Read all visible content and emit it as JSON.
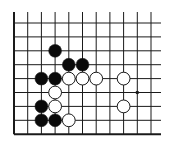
{
  "diagram": {
    "type": "go-board-fragment",
    "columns": 11,
    "rows": 9,
    "edges": {
      "left": "board-edge",
      "bottom": "board-edge",
      "top": "open",
      "right": "open"
    },
    "star_points": [
      {
        "col": 9,
        "row": 5
      }
    ],
    "stones": [
      {
        "color": "black",
        "col": 3,
        "row": 2
      },
      {
        "color": "black",
        "col": 4,
        "row": 3
      },
      {
        "color": "black",
        "col": 5,
        "row": 3
      },
      {
        "color": "black",
        "col": 2,
        "row": 4
      },
      {
        "color": "black",
        "col": 3,
        "row": 4
      },
      {
        "color": "white",
        "col": 4,
        "row": 4
      },
      {
        "color": "white",
        "col": 5,
        "row": 4
      },
      {
        "color": "white",
        "col": 6,
        "row": 4
      },
      {
        "color": "white",
        "col": 8,
        "row": 4
      },
      {
        "color": "white",
        "col": 3,
        "row": 5
      },
      {
        "color": "black",
        "col": 2,
        "row": 6
      },
      {
        "color": "white",
        "col": 3,
        "row": 6
      },
      {
        "color": "white",
        "col": 8,
        "row": 6
      },
      {
        "color": "black",
        "col": 2,
        "row": 7
      },
      {
        "color": "black",
        "col": 3,
        "row": 7
      },
      {
        "color": "white",
        "col": 4,
        "row": 7
      }
    ],
    "colors": {
      "line": "#1a1a1a",
      "black_stone": "#0a0a0a",
      "white_stone": "#ffffff",
      "background": "#ffffff"
    }
  }
}
